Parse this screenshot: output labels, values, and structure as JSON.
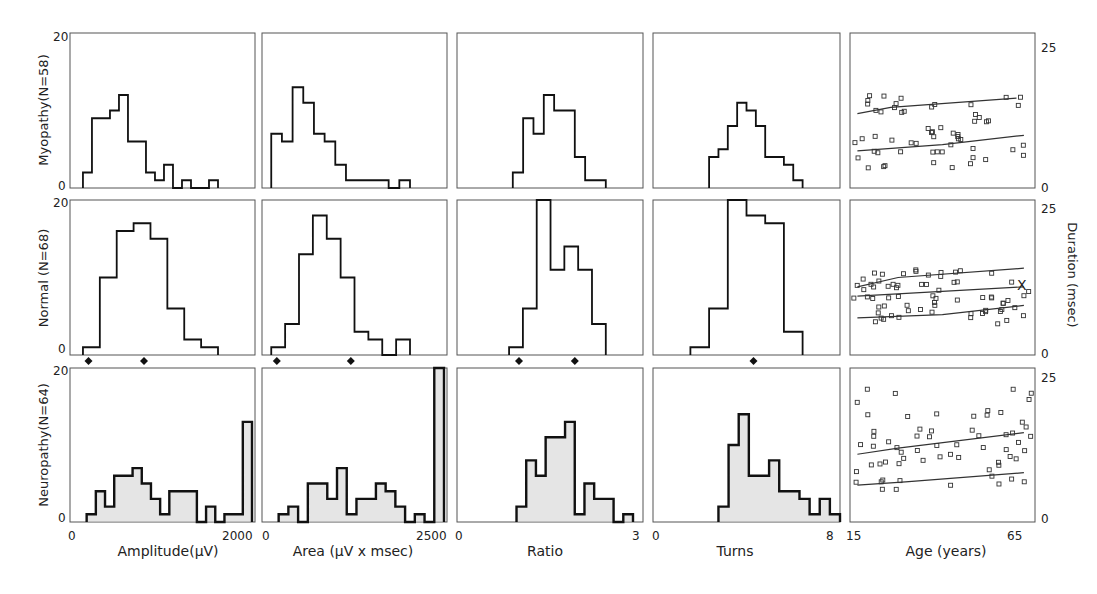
{
  "figure": {
    "row_labels": [
      "Myopathy(N=58)",
      "Normal  (N=68)",
      "Neuropathy(N=64)"
    ],
    "y_tick_hist": {
      "min": "0",
      "max": "20"
    },
    "y_tick_scatter": {
      "min": "0",
      "max": "25"
    },
    "right_axis_label": "Duration (msec)",
    "x_labels": [
      "Amplitude(µV)",
      "Area (µV x msec)",
      "Ratio",
      "Turns",
      "Age (years)"
    ],
    "x_ticks": [
      {
        "min": "0",
        "max": "2000"
      },
      {
        "min": "0",
        "max": "2500"
      },
      {
        "min": "0",
        "max": "3"
      },
      {
        "min": "0",
        "max": "8"
      },
      {
        "min": "15",
        "max": "65"
      }
    ],
    "normal_marker": "X"
  },
  "chart_data": [
    {
      "type": "bar",
      "title": "Myopathy - Amplitude",
      "xlabel": "Amplitude(µV)",
      "ylabel": "Myopathy(N=58)",
      "xlim": [
        0,
        2000
      ],
      "ylim": [
        0,
        20
      ],
      "bins": [
        [
          100,
          2
        ],
        [
          250,
          9
        ],
        [
          500,
          10
        ],
        [
          650,
          12
        ],
        [
          800,
          6
        ],
        [
          1100,
          2
        ],
        [
          1250,
          1
        ],
        [
          1400,
          3
        ],
        [
          1750,
          1
        ],
        [
          2200,
          1
        ]
      ],
      "values": [
        2,
        9,
        9,
        10,
        12,
        6,
        6,
        2,
        1,
        3,
        0,
        1,
        0,
        0,
        1
      ]
    },
    {
      "type": "bar",
      "title": "Myopathy - Area",
      "xlabel": "Area (µV x msec)",
      "xlim": [
        0,
        2500
      ],
      "ylim": [
        0,
        20
      ],
      "values": [
        7,
        6,
        13,
        11,
        7,
        6,
        3,
        1,
        1,
        1,
        1,
        0,
        1
      ]
    },
    {
      "type": "bar",
      "title": "Myopathy - Ratio",
      "xlabel": "Ratio",
      "xlim": [
        0,
        3
      ],
      "ylim": [
        0,
        20
      ],
      "values": [
        2,
        9,
        7,
        12,
        10,
        10,
        4,
        1,
        1
      ]
    },
    {
      "type": "bar",
      "title": "Myopathy - Turns",
      "xlabel": "Turns",
      "xlim": [
        0,
        8
      ],
      "ylim": [
        0,
        20
      ],
      "values": [
        4,
        5,
        8,
        11,
        10,
        8,
        4,
        4,
        3,
        1
      ]
    },
    {
      "type": "scatter",
      "title": "Myopathy - Duration vs Age",
      "xlabel": "Age (years)",
      "ylabel": "Duration (msec)",
      "xlim": [
        15,
        65
      ],
      "ylim": [
        0,
        25
      ],
      "upper_line": [
        [
          17,
          12
        ],
        [
          26,
          13
        ],
        [
          60,
          14.5
        ]
      ],
      "lower_line": [
        [
          17,
          6
        ],
        [
          40,
          7
        ],
        [
          62,
          8.5
        ]
      ]
    },
    {
      "type": "bar",
      "title": "Normal - Amplitude",
      "xlabel": "Amplitude(µV)",
      "ylabel": "Normal (N=68)",
      "xlim": [
        0,
        2000
      ],
      "ylim": [
        0,
        20
      ],
      "values": [
        1,
        10,
        16,
        17,
        15,
        6,
        2,
        1
      ],
      "markers": [
        200,
        800
      ]
    },
    {
      "type": "bar",
      "title": "Normal - Area",
      "xlabel": "Area (µV x msec)",
      "xlim": [
        0,
        2500
      ],
      "ylim": [
        0,
        20
      ],
      "values": [
        1,
        4,
        13,
        18,
        15,
        10,
        3,
        2,
        0,
        2
      ],
      "markers": [
        200,
        1200
      ]
    },
    {
      "type": "bar",
      "title": "Normal - Ratio",
      "xlabel": "Ratio",
      "xlim": [
        0,
        3
      ],
      "ylim": [
        0,
        20
      ],
      "values": [
        1,
        6,
        20,
        11,
        14,
        11,
        4
      ],
      "markers": [
        1.0,
        1.9
      ]
    },
    {
      "type": "bar",
      "title": "Normal - Turns",
      "xlabel": "Turns",
      "xlim": [
        0,
        8
      ],
      "ylim": [
        0,
        20
      ],
      "values": [
        1,
        6,
        20,
        18,
        17,
        3
      ],
      "markers": [
        4.3
      ]
    },
    {
      "type": "scatter",
      "title": "Normal - Duration vs Age",
      "xlabel": "Age (years)",
      "ylabel": "Duration (msec)",
      "xlim": [
        15,
        65
      ],
      "ylim": [
        0,
        25
      ],
      "upper_line": [
        [
          17,
          11
        ],
        [
          28,
          12.5
        ],
        [
          62,
          14
        ]
      ],
      "mid_line": [
        [
          17,
          9.5
        ],
        [
          62,
          11
        ]
      ],
      "lower_line": [
        [
          17,
          6
        ],
        [
          40,
          6.5
        ],
        [
          62,
          8
        ]
      ]
    },
    {
      "type": "bar",
      "title": "Neuropathy - Amplitude",
      "xlabel": "Amplitude(µV)",
      "ylabel": "Neuropathy(N=64)",
      "xlim": [
        0,
        2000
      ],
      "ylim": [
        0,
        20
      ],
      "values": [
        1,
        4,
        2,
        6,
        6,
        7,
        5,
        3,
        1,
        4,
        4,
        4,
        0,
        2,
        0,
        1,
        1,
        13
      ]
    },
    {
      "type": "bar",
      "title": "Neuropathy - Area",
      "xlabel": "Area (µV x msec)",
      "xlim": [
        0,
        2500
      ],
      "ylim": [
        0,
        20
      ],
      "values": [
        1,
        2,
        0,
        5,
        5,
        3,
        7,
        1,
        3,
        3,
        5,
        4,
        2,
        0,
        1,
        0,
        20
      ]
    },
    {
      "type": "bar",
      "title": "Neuropathy - Ratio",
      "xlabel": "Ratio",
      "xlim": [
        0,
        3
      ],
      "ylim": [
        0,
        20
      ],
      "values": [
        2,
        8,
        6,
        11,
        11,
        13,
        1,
        5,
        3,
        3,
        0,
        1
      ]
    },
    {
      "type": "bar",
      "title": "Neuropathy - Turns",
      "xlabel": "Turns",
      "xlim": [
        0,
        8
      ],
      "ylim": [
        0,
        20
      ],
      "values": [
        2,
        10,
        14,
        6,
        6,
        8,
        4,
        4,
        3,
        1,
        3,
        1
      ]
    },
    {
      "type": "scatter",
      "title": "Neuropathy - Duration vs Age",
      "xlabel": "Age (years)",
      "ylabel": "Duration (msec)",
      "xlim": [
        15,
        65
      ],
      "ylim": [
        0,
        25
      ],
      "upper_line": [
        [
          17,
          11
        ],
        [
          28,
          12
        ],
        [
          62,
          14.5
        ]
      ],
      "lower_line": [
        [
          17,
          6
        ],
        [
          30,
          6.5
        ],
        [
          62,
          8
        ]
      ]
    }
  ]
}
